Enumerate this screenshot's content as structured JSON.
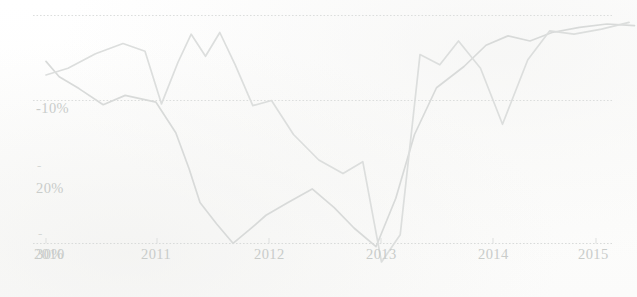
{
  "chart_data": {
    "type": "line",
    "title": "",
    "subtitle": "",
    "xlabel": "",
    "ylabel": "",
    "grid": true,
    "legend_position": "none",
    "xlim": [
      2010,
      2015.4
    ],
    "ylim": [
      -32,
      2
    ],
    "y_ticks": [
      "-10%",
      "-20%",
      "-30%"
    ],
    "y_tick_values": [
      -10,
      -20,
      -30
    ],
    "x_ticks": [
      "2010",
      "2011",
      "2012",
      "2013",
      "2014",
      "2015"
    ],
    "x_tick_values": [
      2010,
      2011,
      2012,
      2013,
      2014,
      2015
    ],
    "line_color_a": "#d9dbda",
    "line_color_b": "#dcdedd",
    "tick_label_color": "#c9ccca",
    "gridline_color": "#dcdedd",
    "series": [
      {
        "name": "Series A",
        "color": "#d8dad9",
        "x": [
          2010.0,
          2010.12,
          2010.3,
          2010.52,
          2010.72,
          2011.0,
          2011.18,
          2011.3,
          2011.4,
          2011.55,
          2011.7,
          2011.85,
          2012.0,
          2012.2,
          2012.42,
          2012.62,
          2012.8,
          2013.0,
          2013.18,
          2013.35,
          2013.55,
          2013.8,
          2014.0,
          2014.2,
          2014.4,
          2014.6,
          2014.85,
          2015.1,
          2015.35
        ],
        "values": [
          -5.4,
          -7.2,
          -8.6,
          -10.5,
          -9.4,
          -10.2,
          -13.8,
          -18.0,
          -22.0,
          -24.5,
          -26.8,
          -25.2,
          -23.5,
          -22.0,
          -20.4,
          -22.6,
          -25.0,
          -27.2,
          -21.5,
          -14.0,
          -8.5,
          -6.0,
          -3.5,
          -2.4,
          -3.0,
          -2.0,
          -1.4,
          -1.0,
          -1.2
        ]
      },
      {
        "name": "Series B",
        "color": "#dcdedd",
        "x": [
          2010.0,
          2010.2,
          2010.45,
          2010.7,
          2010.9,
          2011.05,
          2011.2,
          2011.32,
          2011.45,
          2011.58,
          2011.72,
          2011.88,
          2012.05,
          2012.25,
          2012.48,
          2012.7,
          2012.88,
          2013.05,
          2013.22,
          2013.4,
          2013.58,
          2013.75,
          2013.95,
          2014.15,
          2014.38,
          2014.58,
          2014.8,
          2015.05,
          2015.3
        ],
        "values": [
          -7.0,
          -6.2,
          -4.5,
          -3.3,
          -4.2,
          -10.4,
          -5.5,
          -2.2,
          -4.8,
          -2.0,
          -5.8,
          -10.6,
          -10.0,
          -14.0,
          -17.0,
          -18.6,
          -17.2,
          -29.0,
          -25.8,
          -4.6,
          -5.8,
          -3.0,
          -6.2,
          -12.8,
          -5.2,
          -1.8,
          -2.2,
          -1.6,
          -0.8
        ]
      }
    ]
  },
  "axis": {
    "y_label_neg10": "-10%",
    "y_label_neg20": "20%",
    "y_label_neg30": "30%",
    "minus_sign": "-",
    "x_label_2010": "2010",
    "x_label_2011": "2011",
    "x_label_2012": "2012",
    "x_label_2013": "2013",
    "x_label_2014": "2014",
    "x_label_2015": "2015"
  }
}
